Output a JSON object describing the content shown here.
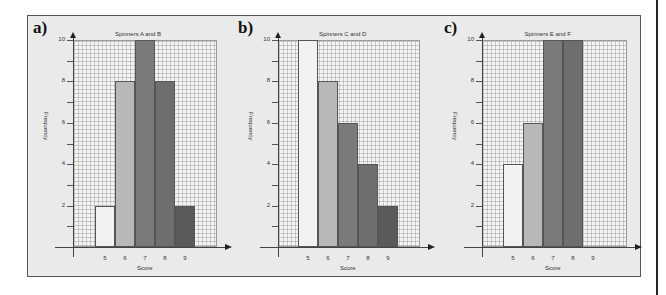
{
  "chart_data": [
    {
      "panel": "a)",
      "type": "bar",
      "title": "Spinners A and B",
      "xlabel": "Score",
      "ylabel": "Frequency",
      "categories": [
        "5",
        "6",
        "7",
        "8",
        "9"
      ],
      "values": [
        2,
        8,
        10,
        8,
        2
      ],
      "ylim": [
        0,
        10
      ],
      "yticks": [
        "2",
        "4",
        "6",
        "8",
        "10"
      ],
      "grid": true,
      "bar_colors": [
        "#f2f2f2",
        "#b8b8b8",
        "#7a7a7a",
        "#6e6e6e",
        "#5a5a5a"
      ]
    },
    {
      "panel": "b)",
      "type": "bar",
      "title": "Spinners C and D",
      "xlabel": "Score",
      "ylabel": "Frequency",
      "categories": [
        "5",
        "6",
        "7",
        "8",
        "9"
      ],
      "values": [
        10,
        8,
        6,
        4,
        2
      ],
      "ylim": [
        0,
        10
      ],
      "yticks": [
        "2",
        "4",
        "6",
        "8",
        "10"
      ],
      "grid": true,
      "bar_colors": [
        "#f2f2f2",
        "#b8b8b8",
        "#7a7a7a",
        "#6e6e6e",
        "#5a5a5a"
      ]
    },
    {
      "panel": "c)",
      "type": "bar",
      "title": "Spinners E and F",
      "xlabel": "Score",
      "ylabel": "Frequency",
      "categories": [
        "5",
        "6",
        "7",
        "8",
        "9"
      ],
      "values": [
        4,
        6,
        10,
        10,
        0
      ],
      "ylim": [
        0,
        10
      ],
      "yticks": [
        "2",
        "4",
        "6",
        "8",
        "10"
      ],
      "grid": true,
      "bar_colors": [
        "#f2f2f2",
        "#b8b8b8",
        "#7a7a7a",
        "#6e6e6e",
        "#5a5a5a"
      ]
    }
  ]
}
